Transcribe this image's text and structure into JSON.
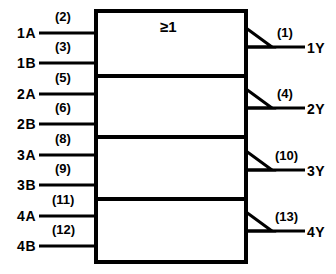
{
  "diagram": {
    "type": "iec-logic-symbol",
    "device": "quad 2-input OR gate",
    "qualifying_symbol": "≥1",
    "colors": {
      "line": "#000000",
      "background": "#ffffff",
      "text": "#000000"
    },
    "gates": [
      {
        "id": "gate-1",
        "inputs": [
          {
            "name": "1A",
            "pin": "(2)"
          },
          {
            "name": "1B",
            "pin": "(3)"
          }
        ],
        "output": {
          "name": "1Y",
          "pin": "(1)"
        }
      },
      {
        "id": "gate-2",
        "inputs": [
          {
            "name": "2A",
            "pin": "(5)"
          },
          {
            "name": "2B",
            "pin": "(6)"
          }
        ],
        "output": {
          "name": "2Y",
          "pin": "(4)"
        }
      },
      {
        "id": "gate-3",
        "inputs": [
          {
            "name": "3A",
            "pin": "(8)"
          },
          {
            "name": "3B",
            "pin": "(9)"
          }
        ],
        "output": {
          "name": "3Y",
          "pin": "(10)"
        }
      },
      {
        "id": "gate-4",
        "inputs": [
          {
            "name": "4A",
            "pin": "(11)"
          },
          {
            "name": "4B",
            "pin": "(12)"
          }
        ],
        "output": {
          "name": "4Y",
          "pin": "(13)"
        }
      }
    ]
  }
}
